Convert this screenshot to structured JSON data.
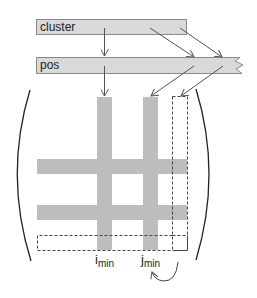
{
  "diagram": {
    "boxes": {
      "cluster": {
        "label": "cluster"
      },
      "pos": {
        "label": "pos"
      }
    },
    "matrix": {
      "stripe_color": "#bdbdbd",
      "box_fill": "#d9d9d9",
      "box_border": "#8a8a8a",
      "line_color": "#555555"
    },
    "labels": {
      "i_min": {
        "base": "i",
        "sub": "min"
      },
      "j_min": {
        "base": "j",
        "sub": "min"
      }
    }
  }
}
